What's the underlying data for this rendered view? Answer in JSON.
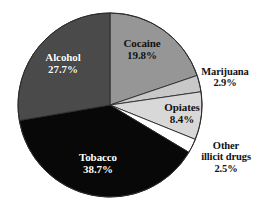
{
  "chart_data": {
    "type": "pie",
    "title": "",
    "subtitle": "",
    "xlabel": "",
    "ylabel": "",
    "legend_position": "none",
    "grid": false,
    "units": "percent",
    "total": 100.0,
    "start_angle_deg": 0,
    "direction": "clockwise",
    "categories": [
      "Cocaine",
      "Marijuana",
      "Opiates",
      "Other illicit drugs",
      "Tobacco",
      "Alcohol"
    ],
    "values": [
      19.8,
      2.9,
      8.4,
      2.5,
      38.7,
      27.7
    ],
    "slices": [
      {
        "name": "Cocaine",
        "value": 19.8,
        "value_text": "19.8%",
        "color": "#969696",
        "label_placement": "inside",
        "label_style": "dark-on-light"
      },
      {
        "name": "Marijuana",
        "value": 2.9,
        "value_text": "2.9%",
        "color": "#c8c8c8",
        "label_placement": "outside",
        "label_style": "dark-on-light"
      },
      {
        "name": "Opiates",
        "value": 8.4,
        "value_text": "8.4%",
        "color": "#d8d8d8",
        "label_placement": "inside",
        "label_style": "dark-on-light"
      },
      {
        "name": "Other illicit drugs",
        "name_line1": "Other",
        "name_line2": "illicit drugs",
        "value": 2.5,
        "value_text": "2.5%",
        "color": "#ffffff",
        "label_placement": "outside",
        "label_style": "dark-on-light"
      },
      {
        "name": "Tobacco",
        "value": 38.7,
        "value_text": "38.7%",
        "color": "#080808",
        "label_placement": "inside",
        "label_style": "light-on-dark"
      },
      {
        "name": "Alcohol",
        "value": 27.7,
        "value_text": "27.7%",
        "color": "#4a4a4a",
        "label_placement": "inside",
        "label_style": "light-on-dark"
      }
    ],
    "colors": {
      "cocaine": "#969696",
      "marijuana": "#c8c8c8",
      "opiates": "#d8d8d8",
      "other_illicit_drugs": "#ffffff",
      "tobacco": "#080808",
      "alcohol": "#4a4a4a",
      "outline": "#2b2b2b",
      "background": "#ffffff"
    }
  }
}
